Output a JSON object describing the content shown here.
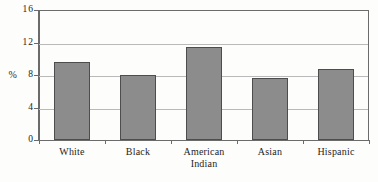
{
  "chart_data": {
    "type": "bar",
    "title": "",
    "subtitle": "",
    "xlabel": "",
    "ylabel": "%",
    "categories": [
      "White",
      "Black",
      "American Indian",
      "Asian",
      "Hispanic"
    ],
    "category_lines": [
      [
        "White"
      ],
      [
        "Black"
      ],
      [
        "American",
        "Indian"
      ],
      [
        "Asian"
      ],
      [
        "Hispanic"
      ]
    ],
    "values": [
      9.6,
      8.0,
      11.5,
      7.6,
      8.7
    ],
    "ylim": [
      0,
      16
    ],
    "yticks": [
      0,
      4,
      8,
      12,
      16
    ],
    "ytick_labels": [
      "0",
      "4",
      "8",
      "12",
      "16"
    ],
    "grid": "horizontal",
    "legend": "none",
    "series": [
      {
        "name": "",
        "values": [
          9.6,
          8.0,
          11.5,
          7.6,
          8.7
        ]
      }
    ],
    "colors": {
      "bar_fill": "#8c8c8c",
      "bar_edge": "#4d4d4d",
      "gridline": "#b9b9b9",
      "axis": "#6b6b6b",
      "text": "#1f1f1f",
      "background": "#fdfdfc"
    }
  }
}
